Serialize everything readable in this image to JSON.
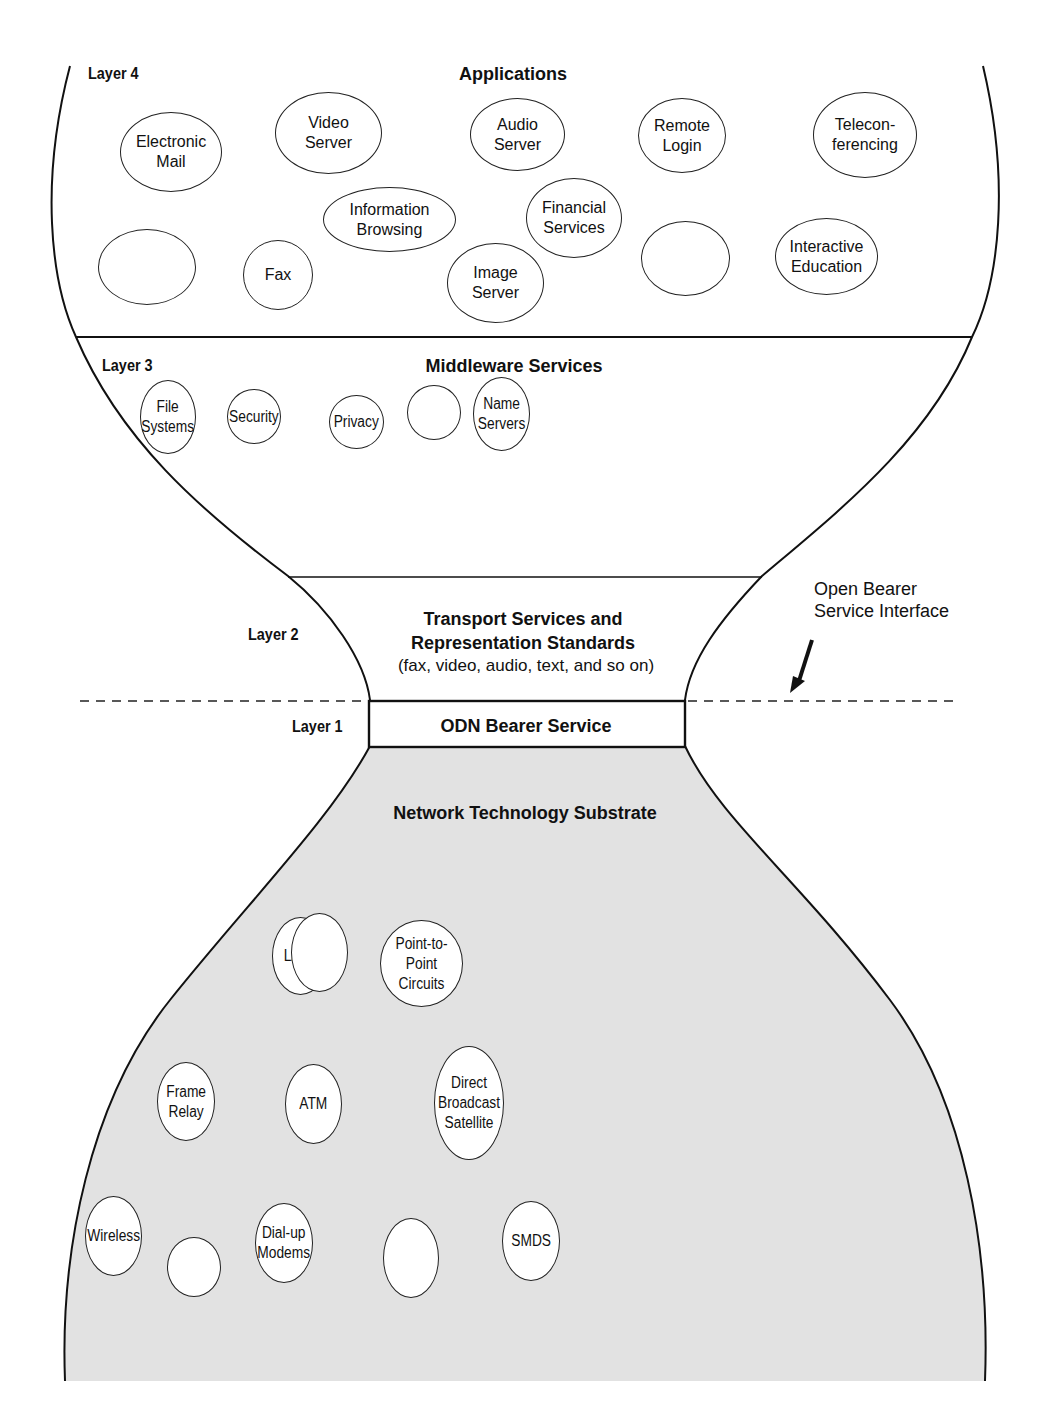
{
  "diagram": {
    "layers": [
      {
        "id": "layer4",
        "label": "Layer 4",
        "title": "Applications"
      },
      {
        "id": "layer3",
        "label": "Layer 3",
        "title": "Middleware Services"
      },
      {
        "id": "layer2",
        "label": "Layer 2",
        "title_line1": "Transport Services and",
        "title_line2": "Representation Standards",
        "subtitle": "(fax, video, audio, text, and so on)"
      },
      {
        "id": "layer1",
        "label": "Layer 1",
        "title": "ODN Bearer Service"
      },
      {
        "id": "substrate",
        "title": "Network Technology Substrate"
      }
    ],
    "applications": [
      {
        "label": "Electronic\nMail"
      },
      {
        "label": "Video\nServer"
      },
      {
        "label": "Audio\nServer"
      },
      {
        "label": "Remote\nLogin"
      },
      {
        "label": "Telecon-\nferencing"
      },
      {
        "label": "Information\nBrowsing"
      },
      {
        "label": "Financial\nServices"
      },
      {
        "label": ""
      },
      {
        "label": "Fax"
      },
      {
        "label": "Image\nServer"
      },
      {
        "label": ""
      },
      {
        "label": "Interactive\nEducation"
      }
    ],
    "middleware": [
      {
        "label": "File\nSystems"
      },
      {
        "label": "Security"
      },
      {
        "label": "Privacy"
      },
      {
        "label": ""
      },
      {
        "label": "Name\nServers"
      },
      {
        "label": "Storage\nRepositories"
      },
      {
        "label": "Service\nDirectories"
      },
      {
        "label": "Multisite\nCoordination"
      },
      {
        "label": ""
      },
      {
        "label": "Electronic\nMoney"
      }
    ],
    "network": [
      {
        "label": "LANs"
      },
      {
        "label": ""
      },
      {
        "label": "Point-to-Point\nCircuits"
      },
      {
        "label": "Frame\nRelay"
      },
      {
        "label": "ATM"
      },
      {
        "label": "Direct\nBroadcast\nSatellite"
      },
      {
        "label": "Wireless"
      },
      {
        "label": ""
      },
      {
        "label": "Dial-up\nModems"
      },
      {
        "label": ""
      },
      {
        "label": "SMDS"
      }
    ],
    "annotation": {
      "line1": "Open Bearer",
      "line2": "Service Interface"
    },
    "colors": {
      "substrate_fill": "#e2e2e2",
      "stroke": "#111111",
      "background": "#ffffff"
    }
  }
}
